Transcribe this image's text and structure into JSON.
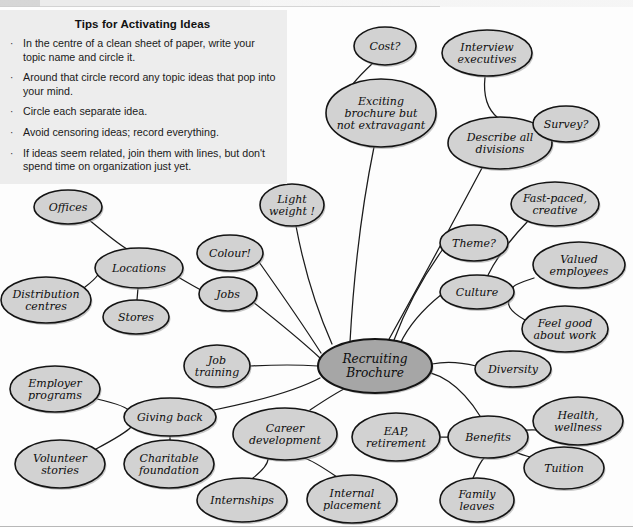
{
  "tips_box": {
    "title": "Tips for Activating Ideas",
    "bullet_glyph": "·",
    "items": [
      "In the centre of a clean sheet of paper, write your topic name and circle it.",
      "Around that circle record any topic ideas that pop into your mind.",
      "Circle each separate idea.",
      "Avoid censoring ideas; record everything.",
      "If ideas seem related, join them with lines, but don't spend time on organization just yet."
    ]
  },
  "colors": {
    "node_fill": "#d2d2d2",
    "center_fill": "#a6a6a6",
    "node_stroke": "#141414",
    "edge_stroke": "#1b1b1b",
    "tips_background": "#ededed",
    "page_background": "#fdfdfd"
  },
  "chart_data": {
    "type": "diagram",
    "diagram_type": "mind-map",
    "center": "Recruiting Brochure",
    "nodes": [
      {
        "id": "center",
        "label": [
          "Recruiting",
          "Brochure"
        ],
        "cx": 375,
        "cy": 366,
        "rx": 57,
        "ry": 27,
        "kind": "center"
      },
      {
        "id": "cost",
        "label": [
          "Cost?"
        ],
        "cx": 385,
        "cy": 46,
        "rx": 31,
        "ry": 19,
        "kind": "leaf"
      },
      {
        "id": "interview",
        "label": [
          "Interview",
          "executives"
        ],
        "cx": 487,
        "cy": 53,
        "rx": 45,
        "ry": 23,
        "kind": "leaf"
      },
      {
        "id": "exciting",
        "label": [
          "Exciting",
          "brochure but",
          "not extravagant"
        ],
        "cx": 381,
        "cy": 113,
        "rx": 55,
        "ry": 34,
        "kind": "leaf"
      },
      {
        "id": "describe",
        "label": [
          "Describe all",
          "divisions"
        ],
        "cx": 500,
        "cy": 143,
        "rx": 52,
        "ry": 26,
        "kind": "leaf"
      },
      {
        "id": "survey",
        "label": [
          "Survey?"
        ],
        "cx": 566,
        "cy": 124,
        "rx": 33,
        "ry": 18,
        "kind": "leaf"
      },
      {
        "id": "fastpaced",
        "label": [
          "Fast-paced,",
          "creative"
        ],
        "cx": 555,
        "cy": 204,
        "rx": 44,
        "ry": 22,
        "kind": "leaf"
      },
      {
        "id": "theme",
        "label": [
          "Theme?"
        ],
        "cx": 474,
        "cy": 243,
        "rx": 34,
        "ry": 18,
        "kind": "leaf"
      },
      {
        "id": "valued",
        "label": [
          "Valued",
          "employees"
        ],
        "cx": 579,
        "cy": 265,
        "rx": 46,
        "ry": 23,
        "kind": "leaf"
      },
      {
        "id": "culture",
        "label": [
          "Culture"
        ],
        "cx": 477,
        "cy": 292,
        "rx": 37,
        "ry": 17,
        "kind": "leaf"
      },
      {
        "id": "feelgood",
        "label": [
          "Feel good",
          "about work"
        ],
        "cx": 565,
        "cy": 329,
        "rx": 43,
        "ry": 23,
        "kind": "leaf"
      },
      {
        "id": "diversity",
        "label": [
          "Diversity"
        ],
        "cx": 513,
        "cy": 369,
        "rx": 38,
        "ry": 18,
        "kind": "leaf"
      },
      {
        "id": "lightweight",
        "label": [
          "Light",
          "weight !"
        ],
        "cx": 292,
        "cy": 205,
        "rx": 32,
        "ry": 21,
        "kind": "leaf"
      },
      {
        "id": "offices",
        "label": [
          "Offices"
        ],
        "cx": 68,
        "cy": 207,
        "rx": 34,
        "ry": 17,
        "kind": "leaf"
      },
      {
        "id": "locations",
        "label": [
          "Locations"
        ],
        "cx": 139,
        "cy": 268,
        "rx": 44,
        "ry": 20,
        "kind": "leaf"
      },
      {
        "id": "distribution",
        "label": [
          "Distribution",
          "centres"
        ],
        "cx": 46,
        "cy": 300,
        "rx": 45,
        "ry": 23,
        "kind": "leaf"
      },
      {
        "id": "stores",
        "label": [
          "Stores"
        ],
        "cx": 136,
        "cy": 317,
        "rx": 33,
        "ry": 17,
        "kind": "leaf"
      },
      {
        "id": "colour",
        "label": [
          "Colour!"
        ],
        "cx": 230,
        "cy": 253,
        "rx": 33,
        "ry": 18,
        "kind": "leaf"
      },
      {
        "id": "jobs",
        "label": [
          "Jobs"
        ],
        "cx": 228,
        "cy": 294,
        "rx": 29,
        "ry": 17,
        "kind": "leaf"
      },
      {
        "id": "jobtraining",
        "label": [
          "Job",
          "training"
        ],
        "cx": 217,
        "cy": 366,
        "rx": 33,
        "ry": 21,
        "kind": "leaf"
      },
      {
        "id": "employer",
        "label": [
          "Employer",
          "programs"
        ],
        "cx": 55,
        "cy": 389,
        "rx": 45,
        "ry": 23,
        "kind": "leaf"
      },
      {
        "id": "givingback",
        "label": [
          "Giving back"
        ],
        "cx": 170,
        "cy": 417,
        "rx": 46,
        "ry": 19,
        "kind": "leaf"
      },
      {
        "id": "volunteer",
        "label": [
          "Volunteer",
          "stories"
        ],
        "cx": 60,
        "cy": 464,
        "rx": 45,
        "ry": 24,
        "kind": "leaf"
      },
      {
        "id": "charitable",
        "label": [
          "Charitable",
          "foundation"
        ],
        "cx": 169,
        "cy": 464,
        "rx": 45,
        "ry": 24,
        "kind": "leaf"
      },
      {
        "id": "career",
        "label": [
          "Career",
          "development"
        ],
        "cx": 285,
        "cy": 434,
        "rx": 52,
        "ry": 26,
        "kind": "leaf"
      },
      {
        "id": "internships",
        "label": [
          "Internships"
        ],
        "cx": 242,
        "cy": 500,
        "rx": 45,
        "ry": 22,
        "kind": "leaf"
      },
      {
        "id": "internal",
        "label": [
          "Internal",
          "placement"
        ],
        "cx": 352,
        "cy": 499,
        "rx": 45,
        "ry": 24,
        "kind": "leaf"
      },
      {
        "id": "eap",
        "label": [
          "EAP,",
          "retirement"
        ],
        "cx": 396,
        "cy": 437,
        "rx": 44,
        "ry": 24,
        "kind": "leaf"
      },
      {
        "id": "benefits",
        "label": [
          "Benefits"
        ],
        "cx": 488,
        "cy": 437,
        "rx": 40,
        "ry": 21,
        "kind": "leaf"
      },
      {
        "id": "health",
        "label": [
          "Health,",
          "wellness"
        ],
        "cx": 578,
        "cy": 421,
        "rx": 45,
        "ry": 24,
        "kind": "leaf"
      },
      {
        "id": "tuition",
        "label": [
          "Tuition"
        ],
        "cx": 564,
        "cy": 468,
        "rx": 40,
        "ry": 21,
        "kind": "leaf"
      },
      {
        "id": "family",
        "label": [
          "Family",
          "leaves"
        ],
        "cx": 477,
        "cy": 500,
        "rx": 37,
        "ry": 22,
        "kind": "leaf"
      }
    ],
    "edges": [
      {
        "from": "cost",
        "to": "exciting",
        "path": "M 373 63 Q 360 75 352 85"
      },
      {
        "from": "interview",
        "to": "describe",
        "path": "M 485 77 Q 482 105 498 118"
      },
      {
        "from": "survey",
        "to": "describe",
        "path": "M 535 131 Q 548 140 549 146"
      },
      {
        "from": "exciting",
        "to": "center",
        "path": "M 374 147 Q 356 235 350 342"
      },
      {
        "from": "describe",
        "to": "center",
        "path": "M 482 168 Q 432 262 388 341"
      },
      {
        "from": "fastpaced",
        "to": "culture",
        "path": "M 528 221 Q 500 250 487 277"
      },
      {
        "from": "valued",
        "to": "culture",
        "path": "M 534 278 Q 512 285 513 288"
      },
      {
        "from": "feelgood",
        "to": "culture",
        "path": "M 525 320 Q 502 307 511 297"
      },
      {
        "from": "theme",
        "to": "center",
        "path": "M 443 249 Q 412 292 394 340"
      },
      {
        "from": "culture",
        "to": "center",
        "path": "M 442 294 Q 412 318 400 344"
      },
      {
        "from": "diversity",
        "to": "center",
        "path": "M 476 366 Q 452 360 432 364"
      },
      {
        "from": "lightweight",
        "to": "center",
        "path": "M 296 226 Q 308 290 332 344"
      },
      {
        "from": "offices",
        "to": "locations",
        "path": "M 88 219 Q 118 244 127 249"
      },
      {
        "from": "distribution",
        "to": "locations",
        "path": "M 85 287 Q 105 272 99 265"
      },
      {
        "from": "stores",
        "to": "locations",
        "path": "M 137 300 L 138 288"
      },
      {
        "from": "locations",
        "to": "jobs",
        "path": "M 178 277 Q 195 287 201 290"
      },
      {
        "from": "colour",
        "to": "center",
        "path": "M 259 262 Q 300 320 321 353"
      },
      {
        "from": "jobs",
        "to": "center",
        "path": "M 253 302 Q 295 335 320 358"
      },
      {
        "from": "jobtraining",
        "to": "center",
        "path": "M 250 366 Q 290 364 318 366"
      },
      {
        "from": "employer",
        "to": "givingback",
        "path": "M 97 399 Q 128 406 130 412"
      },
      {
        "from": "volunteer",
        "to": "givingback",
        "path": "M 96 449 Q 126 433 131 427"
      },
      {
        "from": "charitable",
        "to": "givingback",
        "path": "M 170 440 L 170 436"
      },
      {
        "from": "givingback",
        "to": "center",
        "path": "M 214 410 Q 288 395 320 378"
      },
      {
        "from": "career",
        "to": "center",
        "path": "M 310 410 Q 340 390 352 385"
      },
      {
        "from": "internships",
        "to": "career",
        "path": "M 253 478 Q 268 466 268 459"
      },
      {
        "from": "internal",
        "to": "career",
        "path": "M 337 477 Q 312 460 304 458"
      },
      {
        "from": "eap",
        "to": "benefits",
        "path": "M 440 437 L 448 437"
      },
      {
        "from": "health",
        "to": "benefits",
        "path": "M 537 430 Q 514 429 527 436"
      },
      {
        "from": "tuition",
        "to": "benefits",
        "path": "M 530 457 Q 512 452 512 449"
      },
      {
        "from": "family",
        "to": "benefits",
        "path": "M 473 478 Q 480 462 484 458"
      },
      {
        "from": "benefits",
        "to": "center",
        "path": "M 480 416 Q 450 368 408 370"
      }
    ]
  }
}
